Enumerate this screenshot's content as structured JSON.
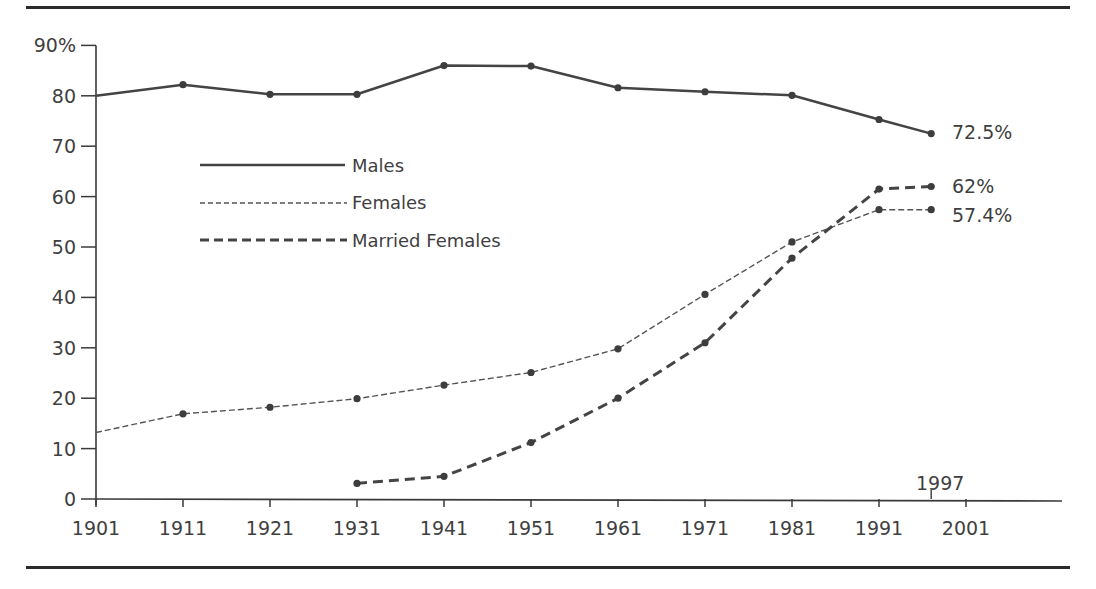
{
  "chart_data": {
    "type": "line",
    "title": "",
    "xlabel": "",
    "ylabel": "",
    "ylim": [
      0,
      90
    ],
    "y_ticks": [
      "0",
      "10",
      "20",
      "30",
      "40",
      "50",
      "60",
      "70",
      "80",
      "90%"
    ],
    "x_ticks": [
      "1901",
      "1911",
      "1921",
      "1931",
      "1941",
      "1951",
      "1961",
      "1971",
      "1981",
      "1991",
      "2001"
    ],
    "x_annotation": "1997",
    "grid": false,
    "legend_position": "upper-left inside",
    "x": [
      1901,
      1911,
      1921,
      1931,
      1941,
      1951,
      1961,
      1971,
      1981,
      1991,
      1997
    ],
    "series": [
      {
        "name": "Males",
        "style": "solid",
        "values": [
          80,
          82.2,
          80.3,
          80.3,
          86,
          85.9,
          81.6,
          80.8,
          80.1,
          75.3,
          72.5
        ],
        "end_label": "72.5%"
      },
      {
        "name": "Females",
        "style": "fine-dashed",
        "values": [
          13.2,
          16.9,
          18.2,
          19.9,
          22.6,
          25.1,
          29.8,
          40.6,
          51,
          57.4,
          57.4
        ],
        "end_label": "57.4%"
      },
      {
        "name": "Married Females",
        "style": "bold-dashed",
        "values": [
          null,
          null,
          null,
          3.1,
          4.5,
          11.2,
          20,
          31,
          47.8,
          61.5,
          62
        ],
        "end_label": "62%"
      }
    ]
  },
  "legend": {
    "males": "Males",
    "females": "Females",
    "married_females": "Married Females"
  },
  "labels": {
    "males_end": "72.5%",
    "married_end": "62%",
    "females_end": "57.4%",
    "year_marker": "1997"
  },
  "colors": {
    "line": "#4a4a4a",
    "axis": "#3a3a3a",
    "rule": "#2b2b2b"
  }
}
